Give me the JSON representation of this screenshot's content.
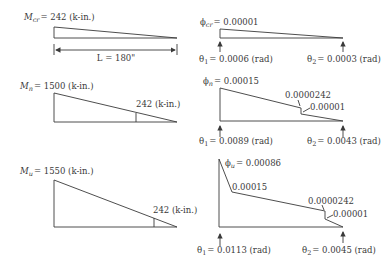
{
  "left_panel": {
    "cracking": {
      "moment_symbol": "M",
      "moment_sub": "cr",
      "moment_value": "= 242 (k-in.)",
      "span_label": "L = 180\""
    },
    "yield": {
      "moment_symbol": "M",
      "moment_sub": "n",
      "moment_value": "= 1500 (k-in.)",
      "crack_moment_label": "242 (k-in.)"
    },
    "ultimate": {
      "moment_symbol": "M",
      "moment_sub": "u",
      "moment_value": "= 1550 (k-in.)",
      "crack_moment_label": "242 (k-in.)"
    }
  },
  "right_panel": {
    "cracking": {
      "phi_symbol": "ϕ",
      "phi_sub": "cr",
      "phi_value": "= 0.00001",
      "theta1_label": "θ",
      "theta1_sub": "1",
      "theta1_value": "= 0.0006 (rad)",
      "theta2_label": "θ",
      "theta2_sub": "2",
      "theta2_value": "= 0.0003 (rad)"
    },
    "yield": {
      "phi_symbol": "ϕ",
      "phi_sub": "n",
      "phi_value": "= 0.00015",
      "step_upper": "0.0000242",
      "step_lower": "0.00001",
      "theta1_label": "θ",
      "theta1_sub": "1",
      "theta1_value": "= 0.0089 (rad)",
      "theta2_label": "θ",
      "theta2_sub": "2",
      "theta2_value": "= 0.0043 (rad)"
    },
    "ultimate": {
      "phi_symbol": "ϕ",
      "phi_sub": "u",
      "phi_value": "= 0.00086",
      "knee_value": "0.00015",
      "step_upper": "0.0000242",
      "step_lower": "0.00001",
      "theta1_label": "θ",
      "theta1_sub": "1",
      "theta1_value": "= 0.0113 (rad)",
      "theta2_label": "θ",
      "theta2_sub": "2",
      "theta2_value": "= 0.0045 (rad)"
    }
  }
}
